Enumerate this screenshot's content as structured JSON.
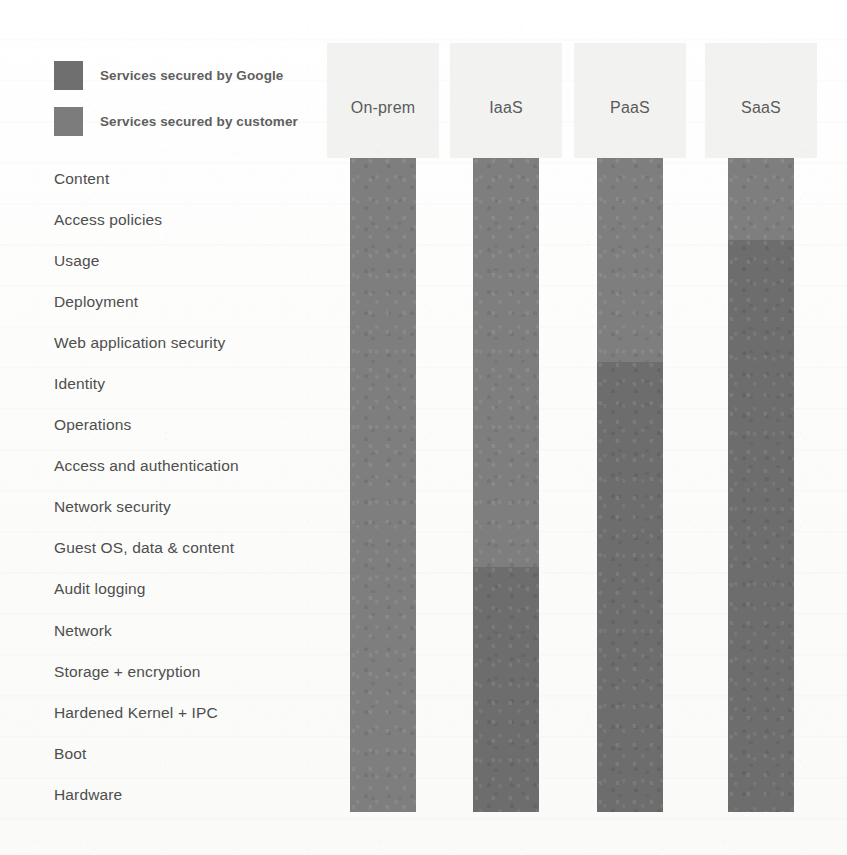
{
  "legend": {
    "items": [
      {
        "label": "Services secured by Google",
        "color": "#6f6f6f",
        "key": "google"
      },
      {
        "label": "Services secured by customer",
        "color": "#7c7c7c",
        "key": "customer"
      }
    ]
  },
  "chart_data": {
    "type": "bar",
    "title": "",
    "xlabel": "",
    "ylabel": "",
    "grid": false,
    "legend_position": "top-left",
    "orientation": "vertical-stacked",
    "categories": [
      "On-prem",
      "IaaS",
      "PaaS",
      "SaaS"
    ],
    "layers": [
      "Content",
      "Access policies",
      "Usage",
      "Deployment",
      "Web application security",
      "Identity",
      "Operations",
      "Access and authentication",
      "Network security",
      "Guest OS, data & content",
      "Audit logging",
      "Network",
      "Storage + encryption",
      "Hardened Kernel + IPC",
      "Boot",
      "Hardware"
    ],
    "series": [
      {
        "name": "Services secured by Google",
        "key": "google",
        "color": "#6d6d6d",
        "values": [
          0,
          6,
          11,
          14
        ]
      },
      {
        "name": "Services secured by customer",
        "key": "customer",
        "color": "#7e7e7e",
        "values": [
          16,
          10,
          5,
          2
        ]
      }
    ],
    "columns": [
      {
        "label": "On-prem",
        "google_layers": 0,
        "customer_layers": 16,
        "customer_from": "Content",
        "customer_to": "Hardware",
        "google_from": "",
        "google_to": ""
      },
      {
        "label": "IaaS",
        "google_layers": 6,
        "customer_layers": 10,
        "customer_from": "Content",
        "customer_to": "Guest OS, data & content",
        "google_from": "Audit logging",
        "google_to": "Hardware"
      },
      {
        "label": "PaaS",
        "google_layers": 11,
        "customer_layers": 5,
        "customer_from": "Content",
        "customer_to": "Web application security",
        "google_from": "Identity",
        "google_to": "Hardware"
      },
      {
        "label": "SaaS",
        "google_layers": 14,
        "customer_layers": 2,
        "customer_from": "Content",
        "customer_to": "Access policies",
        "google_from": "Usage",
        "google_to": "Hardware"
      }
    ]
  }
}
